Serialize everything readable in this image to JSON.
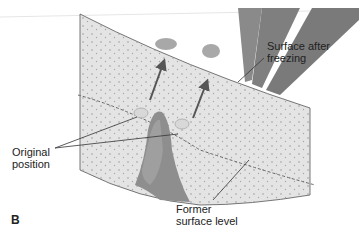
{
  "figure": {
    "panel_label": "B",
    "labels": {
      "surface_after_freezing": [
        "Surface after",
        "freezing"
      ],
      "original_position": [
        "Original",
        "position"
      ],
      "former_surface_level": [
        "Former",
        "surface level"
      ]
    },
    "colors": {
      "soil": "#e4e4e4",
      "soil_dots": "#9a9a9a",
      "stone": "#a8a8a8",
      "ice_wedge": "#8e8e8e",
      "ice_wedge_light": "#b5b5b5",
      "rays": "#7d7d7d",
      "arrow": "#555555",
      "line": "#333333"
    }
  }
}
